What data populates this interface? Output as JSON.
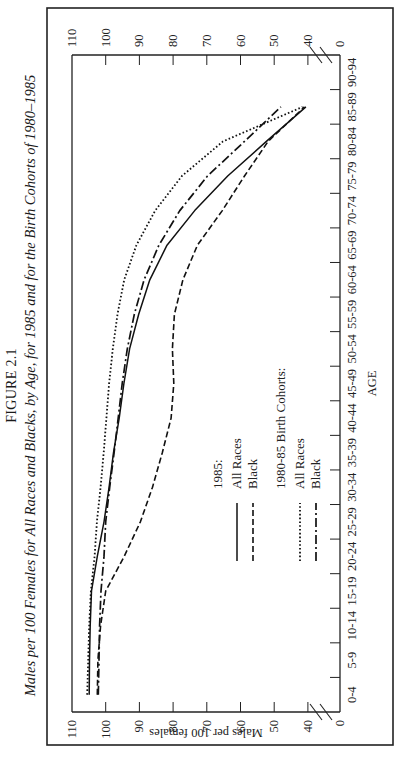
{
  "figure": {
    "label": "FIGURE 2.1",
    "title": "Males per 100 Females for All Races and Blacks, by Age, for 1985 and for the Birth Cohorts of 1980–1985"
  },
  "chart_data": {
    "type": "line",
    "title": "Males per 100 Females for All Races and Blacks, by Age, for 1985 and for the Birth Cohorts of 1980–1985",
    "xlabel": "AGE",
    "ylabel": "Males per 100 females",
    "ylim": [
      0,
      110
    ],
    "y_axis_break": "between 0 and 40",
    "yticks": [
      0,
      40,
      50,
      60,
      70,
      80,
      90,
      100,
      110
    ],
    "grid": false,
    "legend_position": "inside, lower center",
    "categories": [
      "0-4",
      "5-9",
      "10-14",
      "15-19",
      "20-24",
      "25-29",
      "30-34",
      "35-39",
      "40-44",
      "45-49",
      "50-54",
      "55-59",
      "60-64",
      "65-69",
      "70-74",
      "75-79",
      "80-84",
      "85-89",
      "90-94"
    ],
    "series": [
      {
        "name": "1985: All Races",
        "style": "solid",
        "values": [
          104.9,
          104.8,
          104.6,
          104.2,
          102.5,
          100.5,
          99.0,
          97.7,
          96.0,
          94.6,
          92.9,
          90.2,
          86.9,
          81.8,
          73.6,
          63.8,
          52.3,
          40.6,
          null
        ]
      },
      {
        "name": "1985: Black",
        "style": "dashed",
        "values": [
          102.5,
          102.3,
          101.5,
          100.0,
          94.5,
          89.7,
          86.1,
          83.2,
          80.6,
          79.8,
          80.2,
          79.6,
          77.1,
          72.8,
          65.4,
          58.8,
          51.8,
          41.0,
          null
        ]
      },
      {
        "name": "1980-85 Birth Cohorts: All Races",
        "style": "dotted",
        "values": [
          105.5,
          105.2,
          104.9,
          104.4,
          103.3,
          102.6,
          101.5,
          100.6,
          99.8,
          99.0,
          97.9,
          96.5,
          94.5,
          90.9,
          85.3,
          77.4,
          65.2,
          41.6,
          null
        ]
      },
      {
        "name": "1980-85 Birth Cohorts: Black",
        "style": "dash-dot",
        "values": [
          102.2,
          102.0,
          101.8,
          101.4,
          100.5,
          100.0,
          98.8,
          97.5,
          96.3,
          95.1,
          93.6,
          91.5,
          88.6,
          84.2,
          78.0,
          69.8,
          58.8,
          48.0,
          null
        ]
      }
    ]
  },
  "axis": {
    "x_label": "AGE",
    "y_label": "Males per 100 females",
    "y_ticks": [
      "110",
      "100",
      "90",
      "80",
      "70",
      "60",
      "50",
      "40",
      "0"
    ],
    "x_ticks": [
      "0-4",
      "5-9",
      "10-14",
      "15-19",
      "20-24",
      "25-29",
      "30-34",
      "35-39",
      "40-44",
      "45-49",
      "50-54",
      "55-59",
      "60-64",
      "65-69",
      "70-74",
      "75-79",
      "80-84",
      "85-89",
      "90-94"
    ]
  },
  "legend": {
    "group1_title": "1985:",
    "group1_items": [
      "All Races",
      "Black"
    ],
    "group2_title": "1980-85 Birth Cohorts:",
    "group2_items": [
      "All Races",
      "Black"
    ]
  }
}
